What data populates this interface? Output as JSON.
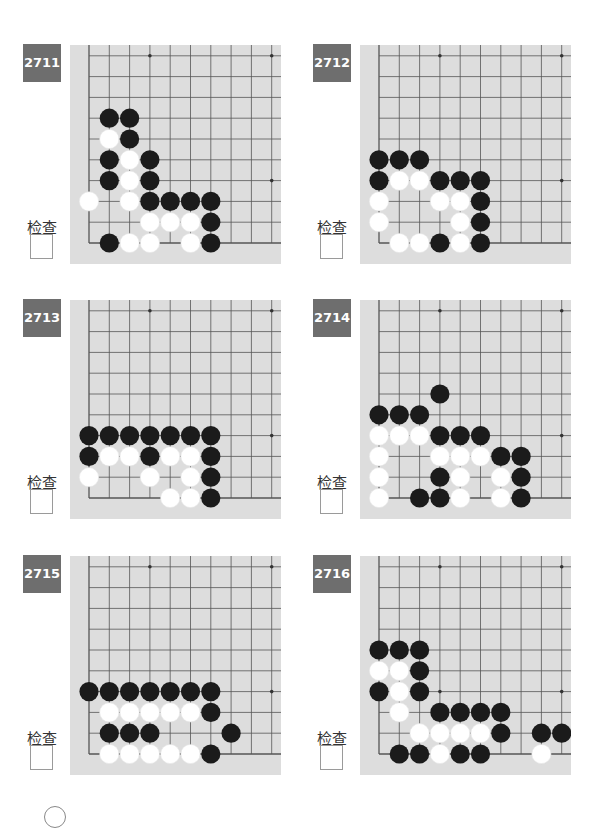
{
  "page": {
    "check_label": "检查",
    "colors": {
      "board": "#dddddd",
      "grid_line": "#555555",
      "label_bg": "#6e6e6e",
      "black_stone": "#1b1b1b",
      "white_stone": "#ffffff"
    }
  },
  "problems": [
    {
      "number": "2711",
      "check_label": "检查",
      "stones": [
        {
          "c": "B",
          "x": 1,
          "y": 6
        },
        {
          "c": "B",
          "x": 2,
          "y": 6
        },
        {
          "c": "W",
          "x": 1,
          "y": 5
        },
        {
          "c": "B",
          "x": 2,
          "y": 5
        },
        {
          "c": "B",
          "x": 1,
          "y": 4
        },
        {
          "c": "W",
          "x": 2,
          "y": 4
        },
        {
          "c": "B",
          "x": 3,
          "y": 4
        },
        {
          "c": "B",
          "x": 1,
          "y": 3
        },
        {
          "c": "W",
          "x": 2,
          "y": 3
        },
        {
          "c": "B",
          "x": 3,
          "y": 3
        },
        {
          "c": "W",
          "x": 0,
          "y": 2
        },
        {
          "c": "W",
          "x": 2,
          "y": 2
        },
        {
          "c": "B",
          "x": 3,
          "y": 2
        },
        {
          "c": "B",
          "x": 4,
          "y": 2
        },
        {
          "c": "B",
          "x": 5,
          "y": 2
        },
        {
          "c": "B",
          "x": 6,
          "y": 2
        },
        {
          "c": "W",
          "x": 3,
          "y": 1
        },
        {
          "c": "W",
          "x": 4,
          "y": 1
        },
        {
          "c": "W",
          "x": 5,
          "y": 1
        },
        {
          "c": "B",
          "x": 6,
          "y": 1
        },
        {
          "c": "B",
          "x": 1,
          "y": 0
        },
        {
          "c": "W",
          "x": 2,
          "y": 0
        },
        {
          "c": "W",
          "x": 3,
          "y": 0
        },
        {
          "c": "W",
          "x": 5,
          "y": 0
        },
        {
          "c": "B",
          "x": 6,
          "y": 0
        }
      ]
    },
    {
      "number": "2712",
      "check_label": "检查",
      "stones": [
        {
          "c": "B",
          "x": 0,
          "y": 4
        },
        {
          "c": "B",
          "x": 1,
          "y": 4
        },
        {
          "c": "B",
          "x": 2,
          "y": 4
        },
        {
          "c": "B",
          "x": 0,
          "y": 3
        },
        {
          "c": "W",
          "x": 1,
          "y": 3
        },
        {
          "c": "W",
          "x": 2,
          "y": 3
        },
        {
          "c": "B",
          "x": 3,
          "y": 3
        },
        {
          "c": "B",
          "x": 4,
          "y": 3
        },
        {
          "c": "B",
          "x": 5,
          "y": 3
        },
        {
          "c": "W",
          "x": 0,
          "y": 2
        },
        {
          "c": "W",
          "x": 3,
          "y": 2
        },
        {
          "c": "W",
          "x": 4,
          "y": 2
        },
        {
          "c": "B",
          "x": 5,
          "y": 2
        },
        {
          "c": "W",
          "x": 0,
          "y": 1
        },
        {
          "c": "W",
          "x": 4,
          "y": 1
        },
        {
          "c": "B",
          "x": 5,
          "y": 1
        },
        {
          "c": "W",
          "x": 1,
          "y": 0
        },
        {
          "c": "W",
          "x": 2,
          "y": 0
        },
        {
          "c": "B",
          "x": 3,
          "y": 0
        },
        {
          "c": "W",
          "x": 4,
          "y": 0
        },
        {
          "c": "B",
          "x": 5,
          "y": 0
        }
      ]
    },
    {
      "number": "2713",
      "check_label": "检查",
      "stones": [
        {
          "c": "B",
          "x": 0,
          "y": 3
        },
        {
          "c": "B",
          "x": 1,
          "y": 3
        },
        {
          "c": "B",
          "x": 2,
          "y": 3
        },
        {
          "c": "B",
          "x": 3,
          "y": 3
        },
        {
          "c": "B",
          "x": 4,
          "y": 3
        },
        {
          "c": "B",
          "x": 5,
          "y": 3
        },
        {
          "c": "B",
          "x": 6,
          "y": 3
        },
        {
          "c": "B",
          "x": 0,
          "y": 2
        },
        {
          "c": "W",
          "x": 1,
          "y": 2
        },
        {
          "c": "W",
          "x": 2,
          "y": 2
        },
        {
          "c": "B",
          "x": 3,
          "y": 2
        },
        {
          "c": "W",
          "x": 4,
          "y": 2
        },
        {
          "c": "W",
          "x": 5,
          "y": 2
        },
        {
          "c": "B",
          "x": 6,
          "y": 2
        },
        {
          "c": "W",
          "x": 0,
          "y": 1
        },
        {
          "c": "W",
          "x": 3,
          "y": 1
        },
        {
          "c": "W",
          "x": 5,
          "y": 1
        },
        {
          "c": "B",
          "x": 6,
          "y": 1
        },
        {
          "c": "W",
          "x": 4,
          "y": 0
        },
        {
          "c": "W",
          "x": 5,
          "y": 0
        },
        {
          "c": "B",
          "x": 6,
          "y": 0
        }
      ]
    },
    {
      "number": "2714",
      "check_label": "检查",
      "stones": [
        {
          "c": "B",
          "x": 3,
          "y": 5
        },
        {
          "c": "B",
          "x": 0,
          "y": 4
        },
        {
          "c": "B",
          "x": 1,
          "y": 4
        },
        {
          "c": "B",
          "x": 2,
          "y": 4
        },
        {
          "c": "W",
          "x": 0,
          "y": 3
        },
        {
          "c": "W",
          "x": 1,
          "y": 3
        },
        {
          "c": "W",
          "x": 2,
          "y": 3
        },
        {
          "c": "B",
          "x": 3,
          "y": 3
        },
        {
          "c": "B",
          "x": 4,
          "y": 3
        },
        {
          "c": "B",
          "x": 5,
          "y": 3
        },
        {
          "c": "W",
          "x": 0,
          "y": 2
        },
        {
          "c": "W",
          "x": 3,
          "y": 2
        },
        {
          "c": "W",
          "x": 4,
          "y": 2
        },
        {
          "c": "W",
          "x": 5,
          "y": 2
        },
        {
          "c": "B",
          "x": 6,
          "y": 2
        },
        {
          "c": "B",
          "x": 7,
          "y": 2
        },
        {
          "c": "W",
          "x": 0,
          "y": 1
        },
        {
          "c": "B",
          "x": 3,
          "y": 1
        },
        {
          "c": "W",
          "x": 4,
          "y": 1
        },
        {
          "c": "W",
          "x": 6,
          "y": 1
        },
        {
          "c": "B",
          "x": 7,
          "y": 1
        },
        {
          "c": "W",
          "x": 0,
          "y": 0
        },
        {
          "c": "B",
          "x": 2,
          "y": 0
        },
        {
          "c": "B",
          "x": 3,
          "y": 0
        },
        {
          "c": "W",
          "x": 4,
          "y": 0
        },
        {
          "c": "W",
          "x": 6,
          "y": 0
        },
        {
          "c": "B",
          "x": 7,
          "y": 0
        }
      ]
    },
    {
      "number": "2715",
      "check_label": "检查",
      "stones": [
        {
          "c": "B",
          "x": 0,
          "y": 3
        },
        {
          "c": "B",
          "x": 1,
          "y": 3
        },
        {
          "c": "B",
          "x": 2,
          "y": 3
        },
        {
          "c": "B",
          "x": 3,
          "y": 3
        },
        {
          "c": "B",
          "x": 4,
          "y": 3
        },
        {
          "c": "B",
          "x": 5,
          "y": 3
        },
        {
          "c": "B",
          "x": 6,
          "y": 3
        },
        {
          "c": "W",
          "x": 1,
          "y": 2
        },
        {
          "c": "W",
          "x": 2,
          "y": 2
        },
        {
          "c": "W",
          "x": 3,
          "y": 2
        },
        {
          "c": "W",
          "x": 4,
          "y": 2
        },
        {
          "c": "W",
          "x": 5,
          "y": 2
        },
        {
          "c": "B",
          "x": 6,
          "y": 2
        },
        {
          "c": "B",
          "x": 1,
          "y": 1
        },
        {
          "c": "B",
          "x": 2,
          "y": 1
        },
        {
          "c": "B",
          "x": 3,
          "y": 1
        },
        {
          "c": "B",
          "x": 7,
          "y": 1
        },
        {
          "c": "W",
          "x": 1,
          "y": 0
        },
        {
          "c": "W",
          "x": 2,
          "y": 0
        },
        {
          "c": "W",
          "x": 3,
          "y": 0
        },
        {
          "c": "W",
          "x": 4,
          "y": 0
        },
        {
          "c": "W",
          "x": 5,
          "y": 0
        },
        {
          "c": "B",
          "x": 6,
          "y": 0
        }
      ]
    },
    {
      "number": "2716",
      "check_label": "检查",
      "stones": [
        {
          "c": "B",
          "x": 0,
          "y": 5
        },
        {
          "c": "B",
          "x": 1,
          "y": 5
        },
        {
          "c": "B",
          "x": 2,
          "y": 5
        },
        {
          "c": "W",
          "x": 0,
          "y": 4
        },
        {
          "c": "W",
          "x": 1,
          "y": 4
        },
        {
          "c": "B",
          "x": 2,
          "y": 4
        },
        {
          "c": "B",
          "x": 0,
          "y": 3
        },
        {
          "c": "W",
          "x": 1,
          "y": 3
        },
        {
          "c": "B",
          "x": 2,
          "y": 3
        },
        {
          "c": "W",
          "x": 1,
          "y": 2
        },
        {
          "c": "B",
          "x": 3,
          "y": 2
        },
        {
          "c": "B",
          "x": 4,
          "y": 2
        },
        {
          "c": "B",
          "x": 5,
          "y": 2
        },
        {
          "c": "B",
          "x": 6,
          "y": 2
        },
        {
          "c": "W",
          "x": 2,
          "y": 1
        },
        {
          "c": "W",
          "x": 3,
          "y": 1
        },
        {
          "c": "W",
          "x": 4,
          "y": 1
        },
        {
          "c": "W",
          "x": 5,
          "y": 1
        },
        {
          "c": "B",
          "x": 6,
          "y": 1
        },
        {
          "c": "B",
          "x": 8,
          "y": 1
        },
        {
          "c": "B",
          "x": 9,
          "y": 1
        },
        {
          "c": "B",
          "x": 1,
          "y": 0
        },
        {
          "c": "B",
          "x": 2,
          "y": 0
        },
        {
          "c": "W",
          "x": 3,
          "y": 0
        },
        {
          "c": "B",
          "x": 4,
          "y": 0
        },
        {
          "c": "B",
          "x": 5,
          "y": 0
        },
        {
          "c": "W",
          "x": 8,
          "y": 0
        }
      ]
    }
  ]
}
